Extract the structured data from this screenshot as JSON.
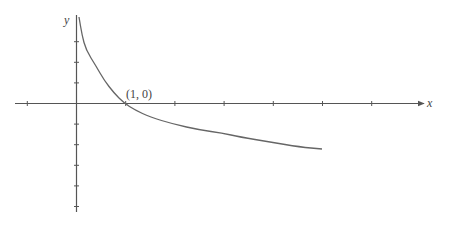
{
  "chart_data": {
    "type": "line",
    "title": "",
    "xlabel": "x",
    "ylabel": "y",
    "annotation": {
      "text": "(1, 0)",
      "x": 1,
      "y": 0
    },
    "x_ticks": [
      -1,
      1,
      2,
      3,
      4,
      5,
      6
    ],
    "y_ticks_up": [
      1,
      2,
      3
    ],
    "y_ticks_down": [
      -1,
      -2,
      -3,
      -4,
      -5
    ],
    "xlim": [
      -1.25,
      7.1
    ],
    "ylim": [
      -5.3,
      4.3
    ],
    "grid": false,
    "series": [
      {
        "name": "curve",
        "description": "decreasing logarithmic curve, vertical asymptote at x=0, crossing x-axis at (1, 0)",
        "points_px": [
          [
            79,
            17
          ],
          [
            82,
            35
          ],
          [
            86,
            50
          ],
          [
            96,
            66
          ],
          [
            104,
            80
          ],
          [
            114,
            93
          ],
          [
            124,
            103
          ],
          [
            135,
            110
          ],
          [
            150,
            117
          ],
          [
            173,
            124
          ],
          [
            200,
            130
          ],
          [
            222,
            133
          ],
          [
            240,
            137
          ],
          [
            270,
            142
          ],
          [
            300,
            147
          ],
          [
            322,
            149
          ]
        ]
      }
    ],
    "colors": {
      "axis": "#555555",
      "curve": "#666666",
      "text": "#444444"
    }
  },
  "labels": {
    "x_axis": "x",
    "y_axis": "y",
    "point": "(1, 0)"
  }
}
